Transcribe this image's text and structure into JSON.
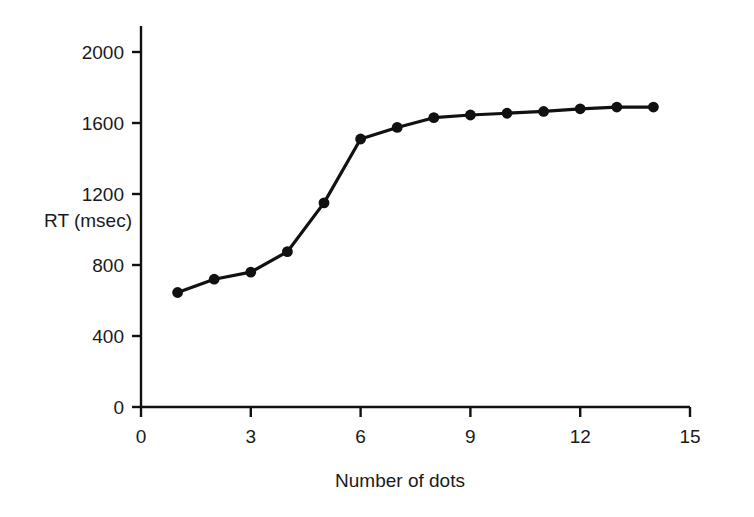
{
  "chart_data": {
    "type": "line",
    "title": "",
    "xlabel": "Number of dots",
    "ylabel": "RT (msec)",
    "x": [
      1,
      2,
      3,
      4,
      5,
      6,
      7,
      8,
      9,
      10,
      11,
      12,
      13,
      14
    ],
    "values": [
      645,
      720,
      760,
      875,
      1150,
      1510,
      1575,
      1630,
      1645,
      1655,
      1665,
      1680,
      1690,
      1690
    ],
    "series": [
      {
        "name": "RT",
        "values": [
          645,
          720,
          760,
          875,
          1150,
          1510,
          1575,
          1630,
          1645,
          1655,
          1665,
          1680,
          1690,
          1690
        ]
      }
    ],
    "xlim": [
      0,
      15
    ],
    "ylim": [
      0,
      2000
    ],
    "xticks": [
      0,
      3,
      6,
      9,
      12,
      15
    ],
    "yticks": [
      0,
      400,
      800,
      1200,
      1600,
      2000
    ],
    "xtick_labels": [
      "0",
      "3",
      "6",
      "9",
      "12",
      "15"
    ],
    "ytick_labels": [
      "0",
      "400",
      "800",
      "1200",
      "1600",
      "2000"
    ],
    "grid": false,
    "legend": false,
    "legend_position": "none",
    "marker": "filled-circle",
    "line_color": "#111111",
    "marker_color": "#111111",
    "background_color": "#ffffff",
    "axis_color": "#111111"
  },
  "axes": {
    "y_label_text": "RT (msec)",
    "x_label_text": "Number of dots"
  }
}
